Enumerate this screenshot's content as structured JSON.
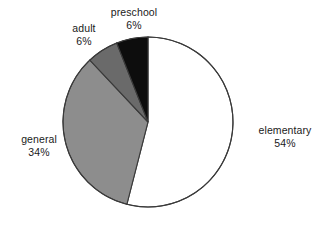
{
  "chart_data": {
    "type": "pie",
    "title": "",
    "subtitle": "",
    "xlabel": "",
    "ylabel": "",
    "legend_position": "none",
    "labels_position": "outside",
    "grid": false,
    "start_angle_deg": 0,
    "direction": "clockwise",
    "categories": [
      "elementary",
      "general",
      "adult",
      "preschool"
    ],
    "values": [
      54,
      34,
      6,
      6
    ],
    "unit": "%",
    "slices": [
      {
        "label": "elementary",
        "value": 54,
        "value_text": "54%",
        "color": "#ffffff",
        "outline": "#3a3a3a",
        "start_deg": 0,
        "end_deg": 194.4
      },
      {
        "label": "general",
        "value": 34,
        "value_text": "34%",
        "color": "#8d8d8d",
        "outline": "#3a3a3a",
        "start_deg": 194.4,
        "end_deg": 316.8
      },
      {
        "label": "adult",
        "value": 6,
        "value_text": "6%",
        "color": "#6a6a6a",
        "outline": "#3a3a3a",
        "start_deg": 316.8,
        "end_deg": 338.4
      },
      {
        "label": "preschool",
        "value": 6,
        "value_text": "6%",
        "color": "#0d0d0d",
        "outline": "#3a3a3a",
        "start_deg": 338.4,
        "end_deg": 360
      }
    ]
  },
  "labels": {
    "preschool": {
      "name": "preschool",
      "value": "6%"
    },
    "adult": {
      "name": "adult",
      "value": "6%"
    },
    "general": {
      "name": "general",
      "value": "34%"
    },
    "elementary": {
      "name": "elementary",
      "value": "54%"
    }
  },
  "colors": {
    "background": "#ffffff",
    "text": "#1a1a1a",
    "outline": "#3a3a3a",
    "elementary": "#ffffff",
    "general": "#8d8d8d",
    "adult": "#6a6a6a",
    "preschool": "#0d0d0d"
  }
}
